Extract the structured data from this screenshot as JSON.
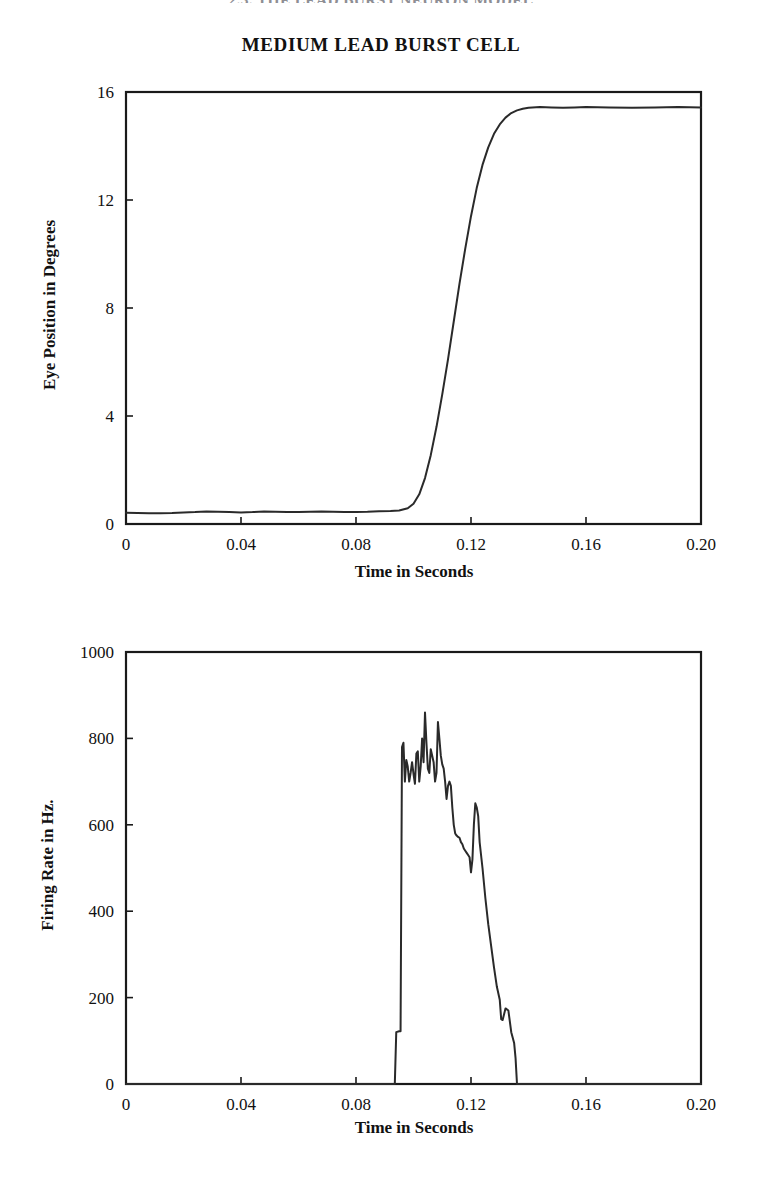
{
  "page": {
    "running_head": "2.3. THE LEAD BURST NEURON MODEL",
    "figure_title": "MEDIUM LEAD BURST CELL",
    "background": "#ffffff",
    "trace_color": "#2a2a2a",
    "axis_color": "#1a1a1a"
  },
  "chart_data": [
    {
      "type": "line",
      "id": "eye-position",
      "title": "MEDIUM LEAD BURST CELL",
      "xlabel": "Time in Seconds",
      "ylabel": "Eye Position in Degrees",
      "xlim": [
        0,
        0.2
      ],
      "ylim": [
        0,
        16
      ],
      "xticks": [
        0,
        0.04,
        0.08,
        0.12,
        0.16,
        0.2
      ],
      "xticklabels": [
        "0",
        "0.04",
        "0.08",
        "0.12",
        "0.16",
        "0.20"
      ],
      "yticks": [
        0,
        4,
        8,
        12,
        16
      ],
      "yticklabels": [
        "0",
        "4",
        "8",
        "12",
        "16"
      ],
      "grid": false,
      "legend": "none",
      "series": [
        {
          "name": "Eye Position",
          "x": [
            0.0,
            0.004,
            0.008,
            0.012,
            0.016,
            0.02,
            0.024,
            0.028,
            0.032,
            0.036,
            0.04,
            0.044,
            0.048,
            0.052,
            0.056,
            0.06,
            0.064,
            0.068,
            0.072,
            0.076,
            0.08,
            0.084,
            0.088,
            0.092,
            0.095,
            0.098,
            0.1,
            0.102,
            0.104,
            0.106,
            0.108,
            0.11,
            0.112,
            0.114,
            0.116,
            0.118,
            0.12,
            0.122,
            0.124,
            0.126,
            0.128,
            0.13,
            0.132,
            0.134,
            0.136,
            0.138,
            0.14,
            0.144,
            0.148,
            0.152,
            0.156,
            0.16,
            0.168,
            0.176,
            0.184,
            0.192,
            0.2
          ],
          "y": [
            0.42,
            0.41,
            0.4,
            0.4,
            0.41,
            0.43,
            0.44,
            0.46,
            0.45,
            0.44,
            0.43,
            0.44,
            0.46,
            0.45,
            0.44,
            0.44,
            0.45,
            0.46,
            0.45,
            0.44,
            0.44,
            0.45,
            0.47,
            0.48,
            0.5,
            0.58,
            0.75,
            1.1,
            1.7,
            2.55,
            3.6,
            4.8,
            6.1,
            7.5,
            8.9,
            10.2,
            11.4,
            12.45,
            13.3,
            13.95,
            14.45,
            14.8,
            15.05,
            15.22,
            15.32,
            15.38,
            15.42,
            15.44,
            15.43,
            15.42,
            15.43,
            15.44,
            15.43,
            15.42,
            15.43,
            15.44,
            15.43
          ]
        }
      ]
    },
    {
      "type": "line",
      "id": "firing-rate",
      "title": "",
      "xlabel": "Time in Seconds",
      "ylabel": "Firing Rate in Hz.",
      "xlim": [
        0,
        0.2
      ],
      "ylim": [
        0,
        1000
      ],
      "xticks": [
        0,
        0.04,
        0.08,
        0.12,
        0.16,
        0.2
      ],
      "xticklabels": [
        "0",
        "0.04",
        "0.08",
        "0.12",
        "0.16",
        "0.20"
      ],
      "yticks": [
        0,
        200,
        400,
        600,
        800,
        1000
      ],
      "yticklabels": [
        "0",
        "200",
        "400",
        "600",
        "800",
        "1000"
      ],
      "grid": false,
      "legend": "none",
      "burst_onset": 0.095,
      "burst_offset": 0.136,
      "peak_rate": 865,
      "series": [
        {
          "name": "Firing Rate",
          "x": [
            0.0,
            0.09,
            0.0935,
            0.094,
            0.095,
            0.0955,
            0.096,
            0.0965,
            0.097,
            0.0975,
            0.098,
            0.0985,
            0.099,
            0.0995,
            0.1,
            0.1005,
            0.101,
            0.1015,
            0.102,
            0.1025,
            0.103,
            0.1035,
            0.104,
            0.1045,
            0.105,
            0.1055,
            0.106,
            0.1065,
            0.107,
            0.1075,
            0.108,
            0.1085,
            0.109,
            0.1095,
            0.11,
            0.1105,
            0.111,
            0.1115,
            0.112,
            0.1125,
            0.113,
            0.1135,
            0.114,
            0.1145,
            0.115,
            0.1155,
            0.116,
            0.1165,
            0.117,
            0.1175,
            0.118,
            0.1185,
            0.119,
            0.1195,
            0.12,
            0.1205,
            0.121,
            0.1215,
            0.122,
            0.1225,
            0.123,
            0.124,
            0.125,
            0.126,
            0.127,
            0.128,
            0.129,
            0.13,
            0.1305,
            0.131,
            0.132,
            0.133,
            0.134,
            0.135,
            0.1355,
            0.136,
            0.14,
            0.2
          ],
          "y": [
            0,
            0,
            0,
            120,
            122,
            122,
            780,
            790,
            700,
            750,
            735,
            700,
            720,
            745,
            718,
            695,
            765,
            770,
            700,
            735,
            800,
            745,
            860,
            790,
            730,
            720,
            775,
            760,
            745,
            700,
            720,
            838,
            800,
            760,
            740,
            730,
            700,
            660,
            690,
            700,
            690,
            640,
            600,
            580,
            575,
            572,
            570,
            560,
            555,
            545,
            540,
            535,
            530,
            525,
            490,
            520,
            600,
            650,
            640,
            620,
            560,
            500,
            430,
            370,
            320,
            270,
            225,
            195,
            150,
            148,
            175,
            170,
            120,
            95,
            60,
            0,
            0,
            0
          ]
        }
      ]
    }
  ]
}
